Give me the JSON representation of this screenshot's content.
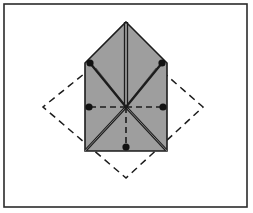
{
  "figure": {
    "title": "Folded paper diagram with radial crease lines",
    "canvas": {
      "width": 253,
      "height": 213,
      "background": "#ffffff"
    },
    "frame": {
      "name": "outer-border",
      "x": 4,
      "y": 4,
      "width": 243,
      "height": 203,
      "stroke": "#2b2b2b",
      "stroke_width": 1.6,
      "fill": "#ffffff"
    },
    "colors": {
      "paper_fill": "#9e9e9e",
      "outline": "#1c1c1c",
      "dashed_guide": "#1c1c1c",
      "dot_fill": "#121212",
      "background": "#ffffff"
    },
    "shapes": {
      "dashed_diamond": {
        "label": "dashed-square-rotated-45",
        "points": "126,40 203,107 126,178 43,107",
        "stroke": "#1c1c1c",
        "stroke_width": 1.5,
        "dash_pattern": "7,5",
        "fill": "none"
      },
      "paper_pentagon": {
        "label": "shaded-pentagon-house-shape",
        "points": "126,22 167,63 167,151 85,151 85,63",
        "fill": "#9e9e9e",
        "stroke": "#1c1c1c",
        "stroke_width": 1.6
      }
    },
    "center": {
      "x": 126,
      "y": 107
    },
    "spokes": [
      {
        "name": "spoke-up-vertical",
        "x2": 126,
        "y2": 22,
        "style": "solid-double",
        "dot": false,
        "width": 1.4
      },
      {
        "name": "spoke-upper-left",
        "x2": 90,
        "y2": 63,
        "style": "solid-thick",
        "dot": true,
        "width": 2.4
      },
      {
        "name": "spoke-upper-right",
        "x2": 162,
        "y2": 63,
        "style": "solid-thick",
        "dot": true,
        "width": 2.4
      },
      {
        "name": "spoke-left-horizontal",
        "x2": 89,
        "y2": 107,
        "style": "dashed",
        "dot": true,
        "width": 1.4
      },
      {
        "name": "spoke-right-horizontal",
        "x2": 163,
        "y2": 107,
        "style": "dashed",
        "dot": true,
        "width": 1.4
      },
      {
        "name": "spoke-lower-left",
        "x2": 86,
        "y2": 150,
        "style": "solid-thick",
        "dot": false,
        "width": 2.6
      },
      {
        "name": "spoke-lower-right",
        "x2": 166,
        "y2": 150,
        "style": "solid-thick",
        "dot": false,
        "width": 2.6
      },
      {
        "name": "spoke-down-vertical",
        "x2": 126,
        "y2": 147,
        "style": "dashed",
        "dot": true,
        "width": 1.4
      }
    ],
    "dots": [
      {
        "name": "dot-upper-left",
        "cx": 90,
        "cy": 63,
        "r": 3.6
      },
      {
        "name": "dot-upper-right",
        "cx": 162,
        "cy": 63,
        "r": 3.6
      },
      {
        "name": "dot-left",
        "cx": 89,
        "cy": 107,
        "r": 3.6
      },
      {
        "name": "dot-right",
        "cx": 163,
        "cy": 107,
        "r": 3.6
      },
      {
        "name": "dot-bottom",
        "cx": 126,
        "cy": 147,
        "r": 3.6
      }
    ],
    "double_lines": [
      {
        "name": "ridge-crease-vertical",
        "x1": 126,
        "y1": 22,
        "x2": 126,
        "y2": 107,
        "offset": 1.5
      },
      {
        "name": "ridge-crease-lower-left",
        "x1": 126,
        "y1": 107,
        "x2": 86,
        "y2": 150,
        "offset": 1.6
      },
      {
        "name": "ridge-crease-lower-right",
        "x1": 126,
        "y1": 107,
        "x2": 166,
        "y2": 150,
        "offset": 1.6
      }
    ],
    "thin_guides": [
      {
        "name": "guide-upper-left-inner",
        "x1": 96,
        "y1": 68,
        "x2": 122,
        "y2": 101
      },
      {
        "name": "guide-upper-right-inner",
        "x1": 156,
        "y1": 68,
        "x2": 130,
        "y2": 101
      }
    ]
  }
}
